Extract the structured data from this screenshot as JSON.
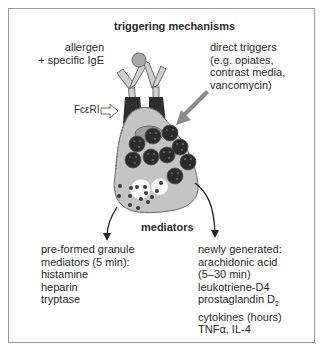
{
  "diagram": {
    "title": "triggering mechanisms",
    "allergen_label": [
      "allergen",
      "+ specific IgE"
    ],
    "receptor_label": "FcεRI",
    "direct_triggers_label": [
      "direct triggers",
      "(e.g. opiates,",
      "contrast media,",
      "vancomycin)"
    ],
    "mediators_title": "mediators",
    "preformed": {
      "lines": [
        "pre-formed granule",
        "mediators (5 min):",
        "histamine",
        "heparin",
        "tryptase"
      ]
    },
    "newly_generated": {
      "lines": [
        "newly generated:",
        "arachidonic acid",
        "(5–30 min)",
        "leukotriene-D4"
      ],
      "prostaglandin": "prostaglandin D",
      "prostaglandin_sub": "2",
      "cytokines_lines": [
        "cytokines (hours)",
        "TNFα, IL-4"
      ]
    },
    "colors": {
      "frame": "#9a9a9a",
      "cell_fill": "#c4c4c4",
      "granule": "#2b2b2b",
      "receptor": "#2e2e2e",
      "antibody": "#c8c8c8",
      "arrow_direct": "#8a8a8a",
      "nucleus": "#9c9c9c"
    }
  }
}
